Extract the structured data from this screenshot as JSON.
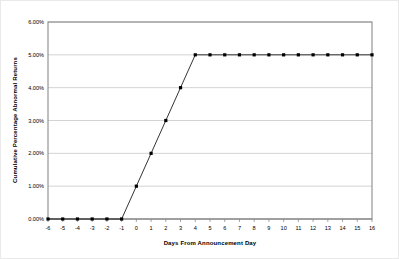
{
  "chart_data": {
    "type": "line",
    "title": "",
    "subtitle": "",
    "xlabel": "Days From Announcement Day",
    "ylabel": "Cumulative Percentage Abnormal Returns",
    "x": [
      -6,
      -5,
      -4,
      -3,
      -2,
      -1,
      0,
      1,
      2,
      3,
      4,
      5,
      6,
      7,
      8,
      9,
      10,
      11,
      12,
      13,
      14,
      15,
      16
    ],
    "xtick_labels": [
      "-6",
      "-5",
      "-4",
      "-3",
      "-2",
      "-1",
      "0",
      "1",
      "2",
      "3",
      "4",
      "5",
      "6",
      "7",
      "8",
      "9",
      "10",
      "11",
      "12",
      "13",
      "14",
      "15",
      "16"
    ],
    "values": [
      0.0,
      0.0,
      0.0,
      0.0,
      0.0,
      0.0,
      1.0,
      2.0,
      3.0,
      4.0,
      5.0,
      5.0,
      5.0,
      5.0,
      5.0,
      5.0,
      5.0,
      5.0,
      5.0,
      5.0,
      5.0,
      5.0,
      5.0
    ],
    "series": [
      {
        "name": "Cumulative Percentage Abnormal Returns",
        "values": [
          0.0,
          0.0,
          0.0,
          0.0,
          0.0,
          0.0,
          1.0,
          2.0,
          3.0,
          4.0,
          5.0,
          5.0,
          5.0,
          5.0,
          5.0,
          5.0,
          5.0,
          5.0,
          5.0,
          5.0,
          5.0,
          5.0,
          5.0
        ],
        "color": "#000000",
        "marker": "square",
        "line_width": 0.8
      }
    ],
    "ylim": [
      0,
      6
    ],
    "yticks": [
      0,
      1,
      2,
      3,
      4,
      5,
      6
    ],
    "ytick_labels": [
      "0.00%",
      "1.00%",
      "2.00%",
      "3.00%",
      "4.00%",
      "5.00%",
      "6.00%"
    ],
    "xlim": [
      -6,
      16
    ],
    "grid": {
      "horizontal": true,
      "vertical": false,
      "color": "#c0c0c0"
    },
    "legend": {
      "visible": false,
      "position": "none"
    },
    "plot_border_color": "#808080",
    "background_color": "#ffffff"
  }
}
